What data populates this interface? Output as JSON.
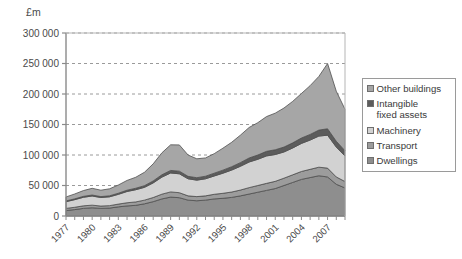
{
  "chart_data": {
    "type": "area",
    "stacked": true,
    "title": "",
    "subtitle": "",
    "xlabel": "",
    "ylabel": "£m",
    "unit_label": "£m",
    "ylim": [
      0,
      300000
    ],
    "ytick_values": [
      0,
      50000,
      100000,
      150000,
      200000,
      250000,
      300000
    ],
    "ytick_labels": [
      "0",
      "50 000",
      "100 000",
      "150 000",
      "200 000",
      "250 000",
      "300 000"
    ],
    "grid": true,
    "grid_style": "dashed-horizontal",
    "legend_position": "right",
    "x": [
      1977,
      1978,
      1979,
      1980,
      1981,
      1982,
      1983,
      1984,
      1985,
      1986,
      1987,
      1988,
      1989,
      1990,
      1991,
      1992,
      1993,
      1994,
      1995,
      1996,
      1997,
      1998,
      1999,
      2000,
      2001,
      2002,
      2003,
      2004,
      2005,
      2006,
      2007,
      2008,
      2009
    ],
    "xtick_labels": [
      "1977",
      "1980",
      "1983",
      "1986",
      "1989",
      "1992",
      "1995",
      "1998",
      "2001",
      "2004",
      "2007"
    ],
    "xtick_label_step": 3,
    "series": [
      {
        "name": "Dwellings",
        "color": "#8e8e8e",
        "values": [
          9000,
          10500,
          12500,
          13500,
          12500,
          13000,
          15000,
          16500,
          17500,
          20000,
          23500,
          28000,
          31000,
          30000,
          26000,
          25000,
          26000,
          28000,
          29000,
          30500,
          33000,
          36000,
          39000,
          42000,
          45000,
          50000,
          55000,
          60000,
          63000,
          66000,
          64000,
          52000,
          46000
        ]
      },
      {
        "name": "Transport",
        "color": "#9c9c9c",
        "values": [
          3500,
          3800,
          4200,
          4300,
          3800,
          4000,
          4500,
          5200,
          5600,
          6000,
          6800,
          7800,
          8500,
          8200,
          7000,
          6800,
          7000,
          7600,
          8200,
          8800,
          9500,
          10500,
          11000,
          11500,
          11800,
          12000,
          12500,
          13000,
          13500,
          14000,
          14500,
          12000,
          10500
        ]
      },
      {
        "name": "Machinery",
        "color": "#d2d2d2",
        "values": [
          11000,
          12500,
          14000,
          15000,
          14000,
          14500,
          16000,
          18500,
          20000,
          21000,
          24000,
          28000,
          31000,
          31000,
          28000,
          27000,
          28000,
          30000,
          33000,
          36000,
          39000,
          42000,
          43000,
          45000,
          44000,
          43000,
          44000,
          46000,
          48000,
          51000,
          54000,
          49000,
          42000
        ]
      },
      {
        "name": "Intangible fixed assets",
        "color": "#5c5c5c",
        "values": [
          1200,
          1300,
          1500,
          1600,
          1500,
          1600,
          1800,
          2100,
          2400,
          2700,
          3200,
          3800,
          4200,
          4300,
          4000,
          4000,
          4200,
          4600,
          5000,
          5500,
          6000,
          6600,
          7000,
          7500,
          7800,
          8000,
          8400,
          8800,
          9200,
          9800,
          10500,
          9500,
          8500
        ]
      },
      {
        "name": "Other buildings",
        "color": "#a6a6a6",
        "values": [
          6500,
          8000,
          9500,
          11000,
          10500,
          11500,
          13500,
          16000,
          18000,
          22000,
          28000,
          36000,
          42000,
          43000,
          35000,
          31000,
          30000,
          32000,
          36000,
          40000,
          45000,
          50000,
          53000,
          57000,
          60000,
          64000,
          68000,
          73000,
          80000,
          88000,
          107000,
          82000,
          68000
        ]
      }
    ]
  },
  "legend": {
    "items": [
      {
        "label": "Other buildings",
        "color": "#a6a6a6"
      },
      {
        "label": "Intangible\nfixed assets",
        "color": "#5c5c5c"
      },
      {
        "label": "Machinery",
        "color": "#d2d2d2"
      },
      {
        "label": "Transport",
        "color": "#9c9c9c"
      },
      {
        "label": "Dwellings",
        "color": "#8e8e8e"
      }
    ]
  },
  "axes": {
    "axis_color": "#8a8a8a",
    "grid_color": "#9a9a9a",
    "text_color": "#4a4a4a"
  }
}
